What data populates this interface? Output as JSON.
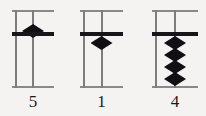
{
  "figure": {
    "background_color": "#f4f3f1",
    "bead_color": "#120f14",
    "frame_color": "#8a8987",
    "bar_color": "#17161a"
  },
  "columns": [
    {
      "id": "column-1",
      "label": "5",
      "heaven_beads_down": 1,
      "earth_beads_up": 0,
      "value": 5,
      "beads": [
        {
          "name": "heaven-bead",
          "position": "above-bar",
          "top": 14
        }
      ]
    },
    {
      "id": "column-2",
      "label": "1",
      "heaven_beads_down": 0,
      "earth_beads_up": 1,
      "value": 1,
      "beads": [
        {
          "name": "earth-bead",
          "position": "below-bar",
          "top": 26
        }
      ]
    },
    {
      "id": "column-3",
      "label": "4",
      "heaven_beads_down": 0,
      "earth_beads_up": 4,
      "value": 4,
      "beads": [
        {
          "name": "earth-bead",
          "position": "below-bar",
          "top": 26
        },
        {
          "name": "earth-bead",
          "position": "below-bar",
          "top": 38
        },
        {
          "name": "earth-bead",
          "position": "below-bar",
          "top": 50
        },
        {
          "name": "earth-bead",
          "position": "below-bar",
          "top": 62
        }
      ]
    }
  ]
}
